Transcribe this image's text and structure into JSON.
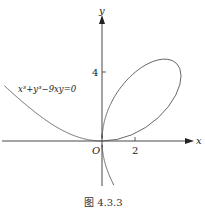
{
  "figure": {
    "caption": "图 4.3.3",
    "equation_label": "x³+y³−9xy=0",
    "axes": {
      "x_label": "x",
      "y_label": "y",
      "origin_label": "O",
      "x_tick_label": "2",
      "y_tick_label": "4"
    },
    "colors": {
      "axis": "#333333",
      "curve": "#555555",
      "background": "#ffffff"
    }
  },
  "chart_data": {
    "type": "line",
    "title": "",
    "curve": "folium of Descartes",
    "equation": "x^3 + y^3 - 9xy = 0",
    "parametric": "x = 9t/(1+t^3), y = 9t^2/(1+t^3)",
    "xlabel": "x",
    "ylabel": "y",
    "x_ticks": [
      2
    ],
    "y_ticks": [
      4
    ],
    "xlim": [
      -6,
      5.5
    ],
    "ylim": [
      -2.6,
      7.5
    ],
    "grid": false,
    "legend": null,
    "annotations": [
      "O",
      "x³+y³−9xy=0",
      "图 4.3.3"
    ],
    "loop_max_x_approx": 4.76,
    "loop_max_y_approx": 4.76
  }
}
